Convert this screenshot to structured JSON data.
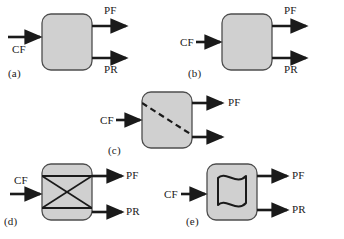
{
  "figure": {
    "background_color": "#ffffff",
    "block_fill_color": "#d0d0d0",
    "block_stroke_color": "#4d4d4d",
    "arrow_color": "#1a1a1a",
    "text_color": "#1a1a1a"
  },
  "panels": [
    {
      "id": "a",
      "label": "(a)",
      "internal": "empty",
      "inputs": [
        {
          "name": "CF",
          "label": "CF",
          "label_position": "below-arrow"
        }
      ],
      "outputs": [
        {
          "name": "PF",
          "label": "PF",
          "label_position": "above-arrow"
        },
        {
          "name": "PR",
          "label": "PR",
          "label_position": "below-arrow"
        }
      ]
    },
    {
      "id": "b",
      "label": "(b)",
      "internal": "empty",
      "inputs": [
        {
          "name": "CF",
          "label": "CF",
          "label_position": "left-of-arrow"
        }
      ],
      "outputs": [
        {
          "name": "PF",
          "label": "PF",
          "label_position": "above-arrow"
        },
        {
          "name": "PR",
          "label": "PR",
          "label_position": "below-arrow"
        }
      ]
    },
    {
      "id": "c",
      "label": "(c)",
      "internal": "dashed-diagonal",
      "inputs": [
        {
          "name": "CF",
          "label": "CF",
          "label_position": "left-of-arrow"
        }
      ],
      "outputs": [
        {
          "name": "PF",
          "label": "PF",
          "label_position": "right-of-arrow"
        },
        {
          "name": "PR",
          "label": "",
          "label_position": "none"
        }
      ]
    },
    {
      "id": "d",
      "label": "(d)",
      "internal": "cross-with-horizontal-lines",
      "inputs": [
        {
          "name": "CF",
          "label": "CF",
          "label_position": "above-arrow"
        }
      ],
      "outputs": [
        {
          "name": "PF",
          "label": "PF",
          "label_position": "right-of-arrow"
        },
        {
          "name": "PR",
          "label": "PR",
          "label_position": "right-of-arrow"
        }
      ]
    },
    {
      "id": "e",
      "label": "(e)",
      "internal": "wavy-flag",
      "inputs": [
        {
          "name": "CF",
          "label": "CF",
          "label_position": "left-of-arrow"
        }
      ],
      "outputs": [
        {
          "name": "PF",
          "label": "PF",
          "label_position": "right-of-arrow"
        },
        {
          "name": "PR",
          "label": "PR",
          "label_position": "right-of-arrow"
        }
      ]
    }
  ]
}
